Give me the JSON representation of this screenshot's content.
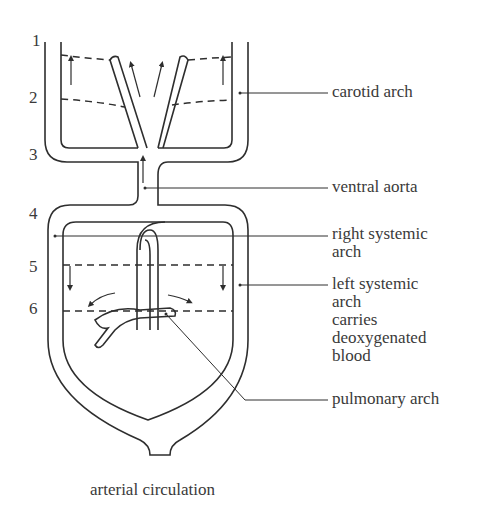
{
  "arch_numbers": [
    "1",
    "2",
    "3",
    "4",
    "5",
    "6"
  ],
  "labels": {
    "carotid_arch": "carotid arch",
    "ventral_aorta": "ventral aorta",
    "right_systemic_arch": [
      "right systemic",
      "arch"
    ],
    "left_systemic_arch": [
      "left systemic",
      "arch",
      "carries",
      "deoxygenated",
      "blood"
    ],
    "pulmonary_arch": "pulmonary arch"
  },
  "caption": "arterial circulation",
  "colors": {
    "line": "#2e2e2e",
    "text": "#3a3a3a",
    "background": "#ffffff"
  }
}
